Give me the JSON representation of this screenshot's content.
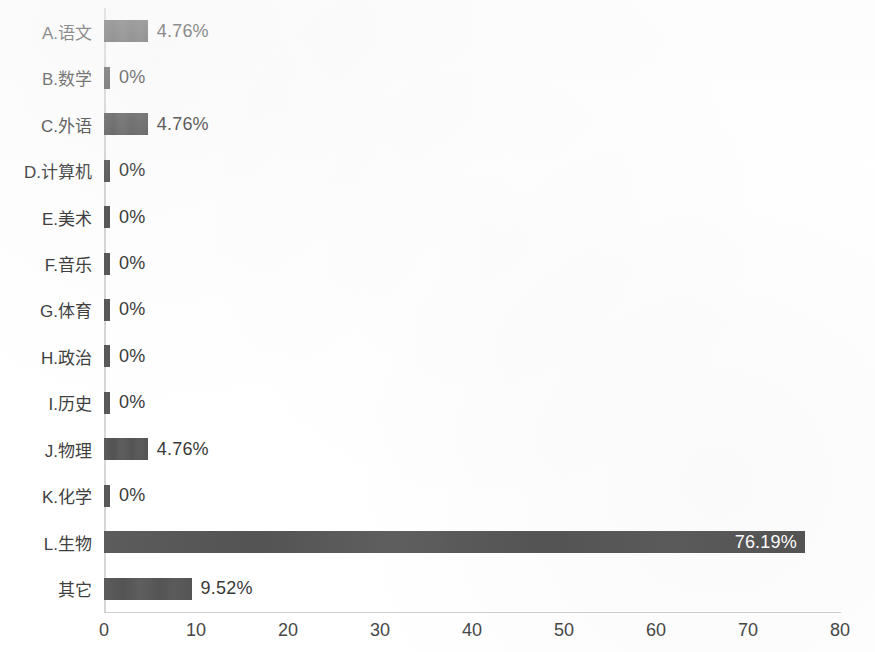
{
  "chart_data": {
    "type": "bar",
    "orientation": "horizontal",
    "title": "",
    "subtitle": "",
    "xlabel": "",
    "ylabel": "",
    "categories": [
      "A.语文",
      "B.数学",
      "C.外语",
      "D.计算机",
      "E.美术",
      "F.音乐",
      "G.体育",
      "H.政治",
      "I.历史",
      "J.物理",
      "K.化学",
      "L.生物",
      "其它"
    ],
    "values": [
      4.76,
      0,
      4.76,
      0,
      0,
      0,
      0,
      0,
      0,
      4.76,
      0,
      76.19,
      9.52
    ],
    "data_labels": [
      "4.76%",
      "0%",
      "4.76%",
      "0%",
      "0%",
      "0%",
      "0%",
      "0%",
      "0%",
      "4.76%",
      "0%",
      "76.19%",
      "9.52%"
    ],
    "label_placement": [
      "outside",
      "outside",
      "outside",
      "outside",
      "outside",
      "outside",
      "outside",
      "outside",
      "outside",
      "outside",
      "outside",
      "inside",
      "outside"
    ],
    "xlim": [
      0,
      80
    ],
    "xticks": [
      0,
      10,
      20,
      30,
      40,
      50,
      60,
      70,
      80
    ],
    "xtick_labels": [
      "0",
      "10",
      "20",
      "30",
      "40",
      "50",
      "60",
      "70",
      "80"
    ],
    "grid": false,
    "legend": false,
    "legend_position": "none",
    "bar_color": "#565656",
    "inside_label_color": "#ffffff",
    "outside_label_color": "#3a3a3a",
    "axis_color": "#d6d6d6",
    "background_color": "#ffffff"
  }
}
